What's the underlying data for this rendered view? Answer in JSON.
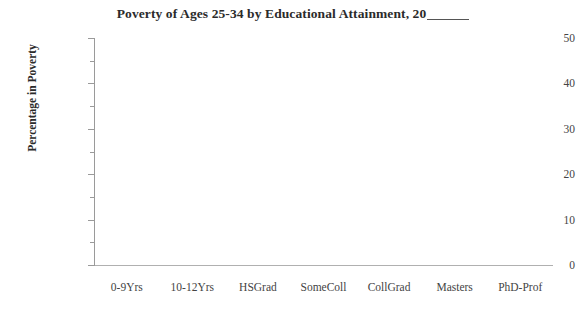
{
  "chart_data": {
    "type": "bar",
    "title_prefix": "Poverty of Ages 25-34 by Educational Attainment, 20",
    "title_blank": "____",
    "xlabel": "",
    "ylabel": "Percentage in Poverty",
    "categories": [
      "0-9Yrs",
      "10-12Yrs",
      "HSGrad",
      "SomeColl",
      "CollGrad",
      "Masters",
      "PhD-Prof"
    ],
    "series": [
      {
        "name": "Percentage in Poverty",
        "values": [
          null,
          null,
          null,
          null,
          null,
          null,
          null
        ]
      }
    ],
    "values": [
      null,
      null,
      null,
      null,
      null,
      null,
      null
    ],
    "ylim": [
      0,
      50
    ],
    "ytick_labels": [
      "50",
      "40",
      "30",
      "20",
      "10",
      "0"
    ],
    "ytick_values": [
      50,
      40,
      30,
      20,
      10,
      0
    ],
    "ytick_minor_values": [
      45,
      35,
      25,
      15,
      5
    ],
    "ytick_step": 10,
    "ytick_minor_step": 5,
    "grid": false,
    "legend": false,
    "legend_position": "none",
    "plot_empty": true,
    "colors": {
      "background": "#ffffff",
      "axis": "#9a9a9a",
      "text": "#3a3a3a",
      "title": "#2b2b2b"
    }
  }
}
